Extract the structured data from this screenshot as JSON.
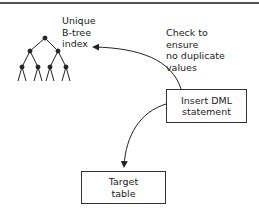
{
  "diagram": {
    "labels": {
      "index": [
        "Unique",
        "B-tree",
        "index"
      ],
      "check": [
        "Check to",
        "ensure",
        "no duplicate",
        "values"
      ]
    },
    "boxes": {
      "insert": [
        "Insert DML",
        "statement"
      ],
      "target": [
        "Target",
        "table"
      ]
    },
    "colors": {
      "line": "#333333",
      "text": "#222222",
      "border_top": "#555555"
    }
  }
}
